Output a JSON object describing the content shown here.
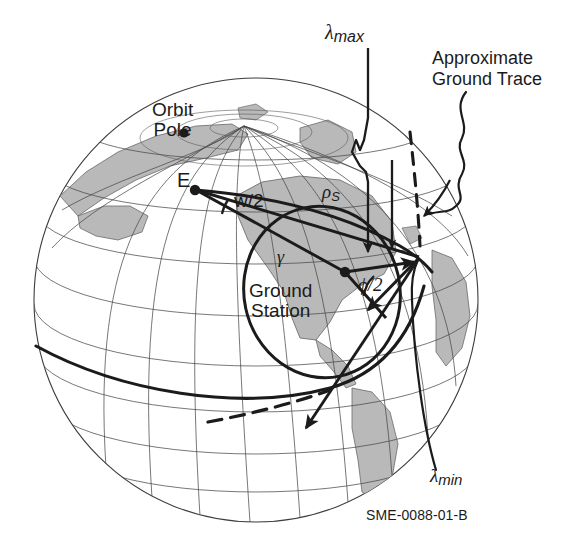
{
  "figure": {
    "id_code": "SME-0088-01-B",
    "type": "technical-diagram",
    "width": 564,
    "height": 550,
    "background_color": "#ffffff",
    "ink_color": "#1b1b1b",
    "land_fill_color": "#b9b9b9",
    "graticule_color": "#4a4a4a"
  },
  "globe": {
    "center_x": 256,
    "center_y": 300,
    "radius": 222,
    "meridian_count": 12,
    "parallel_count": 9
  },
  "labels": {
    "orbit_pole_line1": "Orbit",
    "orbit_pole_line2": "Pole",
    "earth_center": "E",
    "swath_half_width": "w/2",
    "rho_s_base": "ρ",
    "rho_s_sub": "S",
    "gamma": "γ",
    "ground_station_line1": "Ground",
    "ground_station_line2": "Station",
    "phi_half_base": "ϕ",
    "phi_half_rest": "/2",
    "lambda_max_base": "λ",
    "lambda_max_sub": "max",
    "lambda_min_base": "λ",
    "lambda_min_sub": "min",
    "ground_trace_line1": "Approximate",
    "ground_trace_line2": "Ground Trace",
    "figure_id": "SME-0088-01-B"
  },
  "points": {
    "orbit_pole": {
      "x": 184,
      "y": 133
    },
    "earth_center_e": {
      "x": 195,
      "y": 190
    },
    "ground_station": {
      "x": 345,
      "y": 272
    },
    "satellite_vertex": {
      "x": 419,
      "y": 257
    }
  },
  "annotations": [
    {
      "name": "lambda-max",
      "kind": "leader-arrow",
      "target_x": 411,
      "target_y": 262
    },
    {
      "name": "lambda-min",
      "kind": "leader-curve",
      "target_x": 419,
      "target_y": 260
    },
    {
      "name": "approximate-ground-trace",
      "kind": "squiggle-leader-arrow",
      "target_x": 427,
      "target_y": 216
    },
    {
      "name": "coverage-circle",
      "kind": "ellipse"
    },
    {
      "name": "orbit-ground-trace",
      "kind": "curve-solid-and-dashed"
    }
  ]
}
